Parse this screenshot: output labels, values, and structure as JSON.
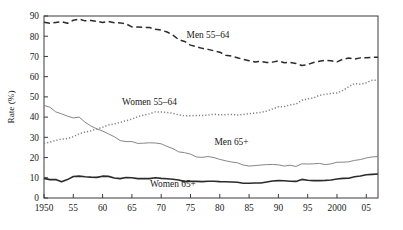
{
  "chart_data": {
    "type": "line",
    "title": "",
    "xlabel": "",
    "ylabel": "Rate (%)",
    "xlim": [
      1950,
      2007
    ],
    "ylim": [
      0,
      90
    ],
    "grid": false,
    "legend_position": "inline-annotations",
    "x_tick_labels": [
      "1950",
      "55",
      "60",
      "65",
      "70",
      "75",
      "80",
      "85",
      "90",
      "95",
      "2000",
      "05"
    ],
    "x_tick_values": [
      1950,
      1955,
      1960,
      1965,
      1970,
      1975,
      1980,
      1985,
      1990,
      1995,
      2000,
      2005
    ],
    "y_tick_labels": [
      "0",
      "10",
      "20",
      "30",
      "40",
      "50",
      "60",
      "70",
      "80",
      "90"
    ],
    "y_tick_values": [
      0,
      10,
      20,
      30,
      40,
      50,
      60,
      70,
      80,
      90
    ],
    "x": [
      1950,
      1951,
      1952,
      1953,
      1954,
      1955,
      1956,
      1957,
      1958,
      1959,
      1960,
      1961,
      1962,
      1963,
      1964,
      1965,
      1966,
      1967,
      1968,
      1969,
      1970,
      1971,
      1972,
      1973,
      1974,
      1975,
      1976,
      1977,
      1978,
      1979,
      1980,
      1981,
      1982,
      1983,
      1984,
      1985,
      1986,
      1987,
      1988,
      1989,
      1990,
      1991,
      1992,
      1993,
      1994,
      1995,
      1996,
      1997,
      1998,
      1999,
      2000,
      2001,
      2002,
      2003,
      2004,
      2005,
      2006,
      2007
    ],
    "series": [
      {
        "name": "Men 55–64",
        "style": "dashed",
        "color": "#2b2b2b",
        "label": "Men 55–64",
        "label_x": 1978,
        "label_y": 79,
        "values": [
          86.9,
          86.4,
          86.8,
          87.2,
          86.4,
          87.9,
          88.5,
          87.6,
          87.8,
          87.4,
          86.8,
          87.3,
          86.7,
          86.6,
          86.1,
          84.6,
          84.5,
          84.4,
          84.3,
          83.4,
          83.0,
          82.1,
          80.5,
          78.3,
          77.4,
          75.6,
          74.8,
          74.0,
          73.5,
          72.8,
          72.1,
          70.6,
          70.2,
          69.4,
          68.5,
          67.9,
          67.3,
          67.6,
          67.0,
          67.2,
          67.8,
          66.9,
          67.0,
          66.5,
          65.5,
          66.0,
          67.0,
          67.6,
          68.1,
          67.9,
          67.3,
          68.6,
          69.2,
          68.7,
          69.3,
          69.3,
          69.6,
          69.6
        ]
      },
      {
        "name": "Women 55–64",
        "style": "dotted",
        "color": "#808080",
        "label": "Women 55–64",
        "label_x": 1968,
        "label_y": 46,
        "values": [
          27.0,
          27.6,
          28.5,
          29.1,
          29.4,
          30.3,
          31.8,
          32.6,
          33.2,
          34.1,
          35.0,
          36.1,
          36.6,
          37.4,
          38.2,
          39.0,
          40.2,
          41.0,
          41.6,
          42.6,
          42.5,
          42.3,
          41.9,
          41.1,
          40.7,
          40.7,
          40.8,
          40.8,
          41.0,
          41.4,
          41.1,
          41.2,
          41.3,
          41.0,
          41.3,
          41.7,
          42.0,
          42.3,
          43.0,
          44.0,
          45.1,
          45.2,
          46.1,
          46.4,
          48.3,
          49.1,
          49.5,
          50.8,
          51.3,
          51.7,
          51.9,
          53.2,
          55.0,
          56.6,
          56.3,
          57.0,
          58.2,
          58.3
        ]
      },
      {
        "name": "Men 65+",
        "style": "solid-thin",
        "color": "#808080",
        "label": "Men 65+",
        "label_x": 1982,
        "label_y": 26,
        "values": [
          45.8,
          44.9,
          42.6,
          41.6,
          40.5,
          39.6,
          40.0,
          37.5,
          35.6,
          34.2,
          33.1,
          31.7,
          30.3,
          28.4,
          27.9,
          27.9,
          27.0,
          27.1,
          27.3,
          27.2,
          26.8,
          25.5,
          24.4,
          22.8,
          22.4,
          21.7,
          20.3,
          20.1,
          20.5,
          20.0,
          19.1,
          18.4,
          17.8,
          17.4,
          16.3,
          15.8,
          16.0,
          16.3,
          16.5,
          16.6,
          16.4,
          15.8,
          16.2,
          15.6,
          16.9,
          16.8,
          16.9,
          17.1,
          16.5,
          16.9,
          17.7,
          17.7,
          17.9,
          18.6,
          19.0,
          19.8,
          20.3,
          20.5
        ]
      },
      {
        "name": "Women 65+",
        "style": "solid-thick",
        "color": "#2b2b2b",
        "label": "Women 65+",
        "label_x": 1972,
        "label_y": 5.5,
        "values": [
          9.7,
          9.1,
          9.1,
          8.0,
          9.1,
          10.6,
          10.8,
          10.5,
          10.3,
          10.2,
          10.8,
          10.7,
          9.9,
          9.6,
          10.1,
          10.0,
          9.6,
          9.6,
          9.6,
          10.0,
          9.7,
          9.5,
          9.3,
          8.9,
          8.1,
          8.2,
          8.2,
          8.1,
          8.3,
          8.3,
          8.1,
          8.0,
          7.9,
          7.8,
          7.3,
          7.3,
          7.4,
          7.4,
          7.9,
          8.4,
          8.6,
          8.5,
          8.3,
          8.2,
          9.2,
          8.8,
          8.6,
          8.6,
          8.7,
          8.9,
          9.4,
          9.7,
          9.8,
          10.5,
          10.9,
          11.5,
          11.7,
          11.9
        ]
      }
    ]
  },
  "axis": {
    "y_title": "Rate (%)"
  }
}
